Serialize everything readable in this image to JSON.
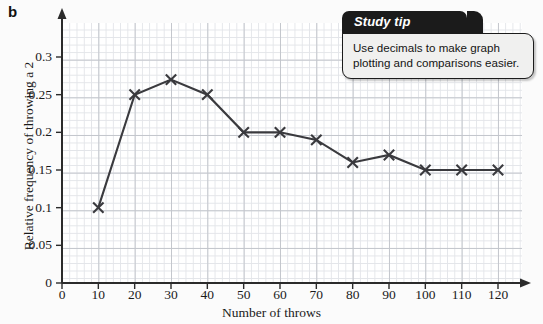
{
  "panel": {
    "letter": "b"
  },
  "chart_data": {
    "type": "line",
    "title": "",
    "xlabel": "Number of throws",
    "ylabel": "Relative frequency of throwing a 2",
    "x": [
      10,
      20,
      30,
      40,
      50,
      60,
      70,
      80,
      90,
      100,
      110,
      120
    ],
    "values": [
      0.1,
      0.25,
      0.27,
      0.25,
      0.2,
      0.2,
      0.19,
      0.16,
      0.17,
      0.15,
      0.15,
      0.15
    ],
    "xlim": [
      0,
      120
    ],
    "ylim": [
      0,
      0.35
    ],
    "xticks": [
      0,
      10,
      20,
      30,
      40,
      50,
      60,
      70,
      80,
      90,
      100,
      110,
      120
    ],
    "xtick_labels": [
      "0",
      "10",
      "20",
      "30",
      "40",
      "50",
      "60",
      "70",
      "80",
      "90",
      "100",
      "110",
      "120"
    ],
    "yticks": [
      0,
      0.05,
      0.1,
      0.15,
      0.2,
      0.25,
      0.3
    ],
    "ytick_labels": [
      "0",
      "0.05",
      "0.1",
      "0.15",
      "0.2",
      "0.25",
      "0.3"
    ],
    "grid": true,
    "legend": null,
    "marker": "x",
    "series_color": "#3a3a3e",
    "grid_major_color": "#c3c6cc",
    "grid_minor_color": "#e3e5e9"
  },
  "study_tip": {
    "header": "Study tip",
    "body": "Use decimals to make graph plotting and comparisons easier."
  }
}
